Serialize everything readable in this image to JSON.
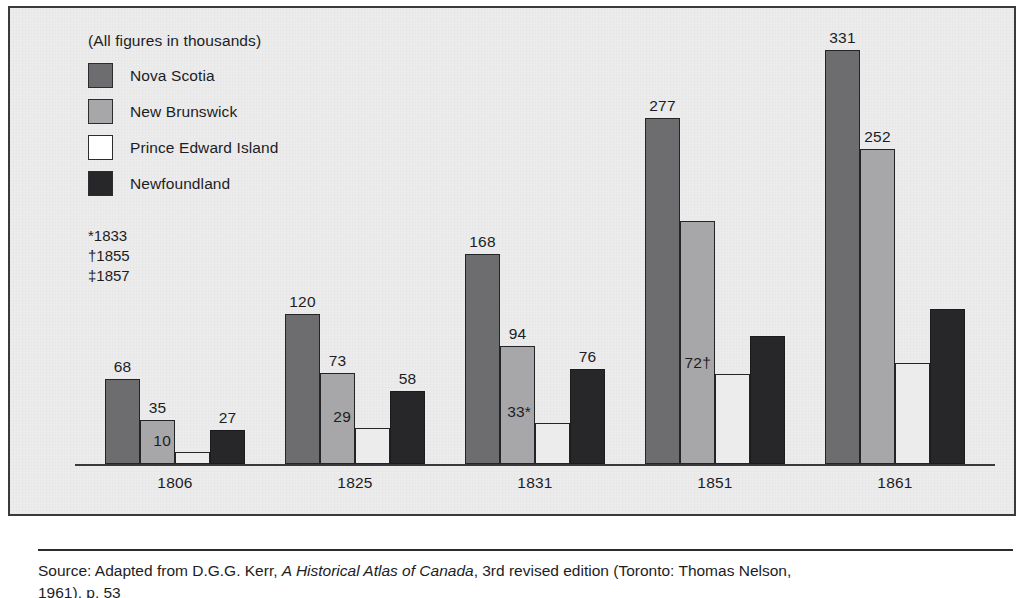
{
  "chart_data": {
    "type": "bar",
    "title": "",
    "caption": "(All figures in thousands)",
    "xlabel": "",
    "ylabel": "",
    "ylim": [
      0,
      345
    ],
    "grid": false,
    "legend_position": "top-left",
    "categories": [
      "1806",
      "1825",
      "1831",
      "1851",
      "1861"
    ],
    "series": [
      {
        "name": "Nova Scotia",
        "color": "#6d6d70",
        "values": [
          68,
          120,
          168,
          277,
          331
        ],
        "labels": [
          "68",
          "120",
          "168",
          "277",
          "331"
        ]
      },
      {
        "name": "New Brunswick",
        "color": "#a7a7a9",
        "values": [
          35,
          73,
          94,
          194,
          252
        ],
        "labels": [
          "35",
          "73",
          "94",
          "",
          "252"
        ]
      },
      {
        "name": "Prince Edward Island",
        "color": "#ffffff",
        "values": [
          10,
          29,
          33,
          72,
          81
        ],
        "labels": [
          "10",
          "29",
          "33*",
          "72†",
          ""
        ]
      },
      {
        "name": "Newfoundland",
        "color": "#27272a",
        "values": [
          27,
          58,
          76,
          102,
          124
        ],
        "labels": [
          "27",
          "58",
          "76",
          "",
          ""
        ]
      }
    ],
    "footnotes": [
      "*1833",
      "†1855",
      "‡1857"
    ],
    "source": {
      "prefix": "Source: Adapted from D.G.G. Kerr, ",
      "italic_title": "A Historical Atlas of Canada",
      "suffix": ", 3rd revised edition (Toronto: Thomas Nelson,",
      "line2": "1961), p. 53"
    }
  }
}
